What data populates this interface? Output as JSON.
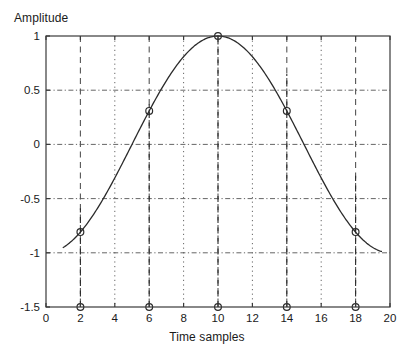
{
  "chart_data": {
    "type": "line",
    "title": "",
    "xlabel": "Time samples",
    "ylabel": "Amplitude",
    "xlim": [
      0,
      20
    ],
    "ylim": [
      -1.5,
      1
    ],
    "xticks": [
      0,
      2,
      4,
      6,
      8,
      10,
      12,
      14,
      16,
      18,
      20
    ],
    "xticklabels": [
      "0",
      "2",
      "4",
      "6",
      "8",
      "10",
      "12",
      "14",
      "16",
      "18",
      "20"
    ],
    "yticks": [
      1,
      0.5,
      0,
      -0.5,
      -1,
      -1.5
    ],
    "yticklabels": [
      "1",
      "0.5",
      "0",
      "-0.5",
      "-1",
      "-1.5"
    ],
    "grid": true,
    "grid_style": "dash-dot",
    "legend": "none",
    "line_color": "#2b2b2b",
    "marker_color": "#2b2b2b",
    "grid_color": "#555555",
    "axis_color": "#3a3a3a",
    "background": "#ffffff",
    "series": [
      {
        "name": "continuous cosine",
        "style": "solid-line",
        "x_start": 1.0,
        "x_end": 19.5,
        "formula": "cos(pi*(t-10)/10)",
        "x": [
          1.0,
          1.5,
          2.0,
          2.5,
          3.0,
          3.5,
          4.0,
          4.5,
          5.0,
          5.5,
          6.0,
          6.5,
          7.0,
          7.5,
          8.0,
          8.5,
          9.0,
          9.5,
          10.0,
          10.5,
          11.0,
          11.5,
          12.0,
          12.5,
          13.0,
          13.5,
          14.0,
          14.5,
          15.0,
          15.5,
          16.0,
          16.5,
          17.0,
          17.5,
          18.0,
          18.5,
          19.0,
          19.5
        ],
        "y": [
          -0.73,
          -0.66,
          -0.59,
          -0.51,
          -0.43,
          -0.34,
          -0.25,
          -0.16,
          -0.06,
          0.03,
          0.37,
          0.47,
          0.57,
          0.66,
          0.73,
          0.79,
          0.88,
          0.95,
          1.0,
          0.99,
          0.95,
          0.89,
          0.81,
          0.71,
          0.59,
          0.45,
          0.65,
          0.5,
          0.31,
          0.16,
          0.0,
          -0.16,
          -0.16,
          -0.22,
          -0.29,
          -0.45,
          -0.59,
          -0.72
        ]
      },
      {
        "name": "samples",
        "style": "stem-circles",
        "baseline": -1.5,
        "x": [
          2,
          6,
          10,
          14,
          18
        ],
        "y": [
          -0.59,
          0.37,
          1.0,
          0.65,
          -0.29
        ]
      }
    ]
  }
}
